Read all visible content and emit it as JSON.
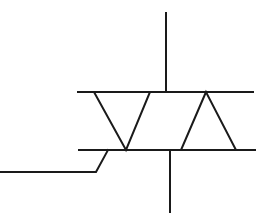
{
  "diagram": {
    "type": "schematic-symbol",
    "component": "triac",
    "stroke_color": "#1a1a1a",
    "background": "#ffffff",
    "elements": {
      "top_rail": {
        "x1": 78,
        "y1": 92,
        "x2": 253,
        "y2": 92
      },
      "bottom_rail": {
        "x1": 79,
        "y1": 150,
        "x2": 255,
        "y2": 150
      },
      "terminal_top": {
        "x1": 166,
        "y1": 13,
        "x2": 166,
        "y2": 92
      },
      "terminal_bottom": {
        "x1": 170,
        "y1": 150,
        "x2": 170,
        "y2": 212
      },
      "triangle_down": {
        "points": "94,92 150,92 126,150"
      },
      "triangle_up": {
        "points": "206,92 181,150 236,150"
      },
      "gate_lead": {
        "points": "0,172 96,172 108,150"
      }
    }
  }
}
